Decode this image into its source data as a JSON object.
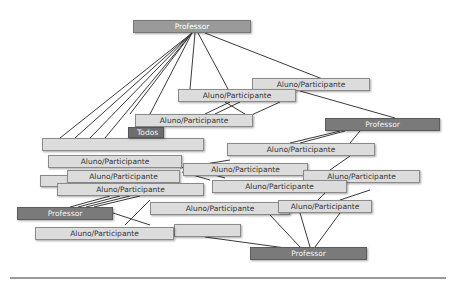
{
  "diagram": {
    "labels": {
      "teacher": "Professor",
      "student": "Aluno/Participante",
      "group": "Todos"
    },
    "nodes": [
      {
        "id": "p_top",
        "kind": "top-teacher",
        "label": "Professor",
        "x": 133,
        "y": 20,
        "w": 118,
        "h": 13
      },
      {
        "id": "blank1",
        "kind": "student",
        "label": "",
        "x": 42,
        "y": 138,
        "w": 162,
        "h": 13
      },
      {
        "id": "blank2",
        "kind": "student",
        "label": "",
        "x": 174,
        "y": 224,
        "w": 67,
        "h": 13
      },
      {
        "id": "blank3",
        "kind": "student",
        "label": "",
        "x": 40,
        "y": 175,
        "w": 60,
        "h": 12
      },
      {
        "id": "a_tr",
        "kind": "student",
        "label": "Aluno/Participante",
        "x": 252,
        "y": 78,
        "w": 118,
        "h": 13
      },
      {
        "id": "a_t2",
        "kind": "student",
        "label": "Aluno/Participante",
        "x": 178,
        "y": 89,
        "w": 118,
        "h": 13
      },
      {
        "id": "a_rm",
        "kind": "student",
        "label": "Aluno/Participante",
        "x": 227,
        "y": 143,
        "w": 148,
        "h": 13
      },
      {
        "id": "a_l1",
        "kind": "student",
        "label": "Aluno/Participante",
        "x": 48,
        "y": 155,
        "w": 134,
        "h": 13
      },
      {
        "id": "a_m1",
        "kind": "student",
        "label": "Aluno/Participante",
        "x": 183,
        "y": 163,
        "w": 125,
        "h": 13
      },
      {
        "id": "a_l2",
        "kind": "student",
        "label": "Aluno/Participante",
        "x": 67,
        "y": 170,
        "w": 113,
        "h": 13
      },
      {
        "id": "a_r2",
        "kind": "student",
        "label": "Aluno/Participante",
        "x": 303,
        "y": 170,
        "w": 117,
        "h": 13
      },
      {
        "id": "a_m2",
        "kind": "student",
        "label": "Aluno/Participante",
        "x": 212,
        "y": 180,
        "w": 135,
        "h": 13
      },
      {
        "id": "a_l3",
        "kind": "student",
        "label": "Aluno/Participante",
        "x": 57,
        "y": 183,
        "w": 147,
        "h": 13
      },
      {
        "id": "a_b1",
        "kind": "student",
        "label": "Aluno/Participante",
        "x": 150,
        "y": 202,
        "w": 140,
        "h": 13
      },
      {
        "id": "a_b2",
        "kind": "student",
        "label": "Aluno/Participante",
        "x": 278,
        "y": 200,
        "w": 94,
        "h": 13
      },
      {
        "id": "a_b3",
        "kind": "student",
        "label": "Aluno/Participante",
        "x": 35,
        "y": 227,
        "w": 139,
        "h": 13
      },
      {
        "id": "a_t3",
        "kind": "student",
        "label": "Aluno/Participante",
        "x": 135,
        "y": 114,
        "w": 118,
        "h": 13
      },
      {
        "id": "todos",
        "kind": "group",
        "label": "Todos",
        "x": 128,
        "y": 127,
        "w": 36,
        "h": 11
      },
      {
        "id": "p_right",
        "kind": "teacher",
        "label": "Professor",
        "x": 325,
        "y": 118,
        "w": 115,
        "h": 13
      },
      {
        "id": "p_left",
        "kind": "teacher",
        "label": "Professor",
        "x": 17,
        "y": 207,
        "w": 96,
        "h": 13
      },
      {
        "id": "p_bot",
        "kind": "teacher",
        "label": "Professor",
        "x": 250,
        "y": 247,
        "w": 117,
        "h": 13
      }
    ],
    "edges": [
      [
        192,
        33,
        60,
        138
      ],
      [
        192,
        33,
        75,
        138
      ],
      [
        192,
        33,
        90,
        138
      ],
      [
        192,
        33,
        105,
        138
      ],
      [
        192,
        33,
        130,
        114
      ],
      [
        192,
        33,
        150,
        114
      ],
      [
        195,
        33,
        190,
        89
      ],
      [
        198,
        33,
        228,
        89
      ],
      [
        205,
        33,
        325,
        80
      ],
      [
        300,
        91,
        395,
        118
      ],
      [
        230,
        102,
        205,
        114
      ],
      [
        240,
        102,
        215,
        114
      ],
      [
        280,
        102,
        245,
        118
      ],
      [
        225,
        102,
        245,
        114
      ],
      [
        340,
        131,
        290,
        143
      ],
      [
        345,
        131,
        300,
        143
      ],
      [
        360,
        131,
        350,
        143
      ],
      [
        350,
        156,
        330,
        170
      ],
      [
        335,
        183,
        318,
        200
      ],
      [
        180,
        168,
        230,
        160
      ],
      [
        185,
        168,
        220,
        170
      ],
      [
        190,
        168,
        225,
        178
      ],
      [
        182,
        172,
        210,
        180
      ],
      [
        70,
        207,
        110,
        196
      ],
      [
        78,
        207,
        120,
        196
      ],
      [
        86,
        207,
        130,
        196
      ],
      [
        94,
        207,
        140,
        196
      ],
      [
        113,
        213,
        150,
        225
      ],
      [
        125,
        225,
        150,
        200
      ],
      [
        240,
        213,
        250,
        202
      ],
      [
        245,
        215,
        255,
        205
      ],
      [
        205,
        237,
        300,
        250
      ],
      [
        270,
        215,
        300,
        247
      ],
      [
        300,
        213,
        310,
        247
      ],
      [
        340,
        213,
        315,
        247
      ],
      [
        370,
        190,
        340,
        200
      ]
    ],
    "divider": true
  }
}
